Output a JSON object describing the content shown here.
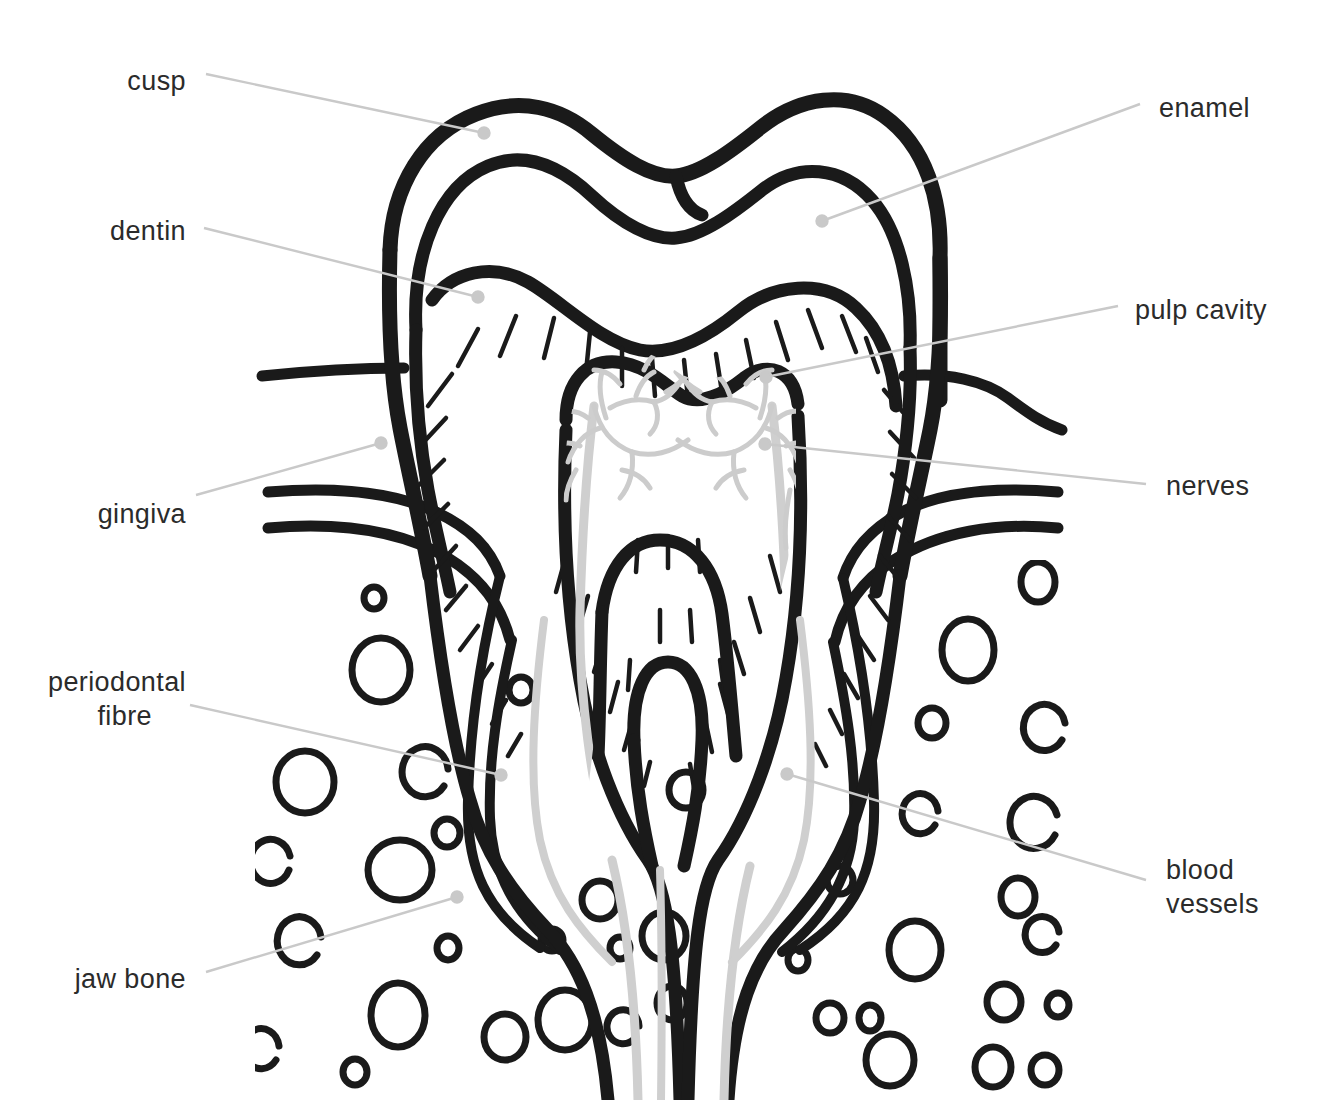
{
  "diagram": {
    "background_color": "#ffffff",
    "ink_color": "#1a1a1a",
    "leader_color": "#c9c9c9",
    "soft_tissue_color": "#d4d4d4",
    "label_color": "#2b2b2b"
  },
  "labels": {
    "left": [
      {
        "id": "cusp",
        "text": "cusp",
        "x": 186,
        "y": 90,
        "dot_x": 484,
        "dot_y": 133
      },
      {
        "id": "dentin",
        "text": "dentin",
        "x": 186,
        "y": 240,
        "dot_x": 478,
        "dot_y": 297
      },
      {
        "id": "gingiva",
        "text": "gingiva",
        "x": 186,
        "y": 523,
        "dot_x": 381,
        "dot_y": 443
      },
      {
        "id": "periodontal-fibre",
        "text": "periodontal",
        "text2": "fibre",
        "x": 186,
        "y": 691,
        "x2": 186,
        "y2": 725,
        "dot_x": 501,
        "dot_y": 775
      },
      {
        "id": "jaw-bone",
        "text": "jaw bone",
        "x": 186,
        "y": 988,
        "dot_x": 457,
        "dot_y": 897
      }
    ],
    "right": [
      {
        "id": "enamel",
        "text": "enamel",
        "x": 1159,
        "y": 117,
        "dot_x": 822,
        "dot_y": 221
      },
      {
        "id": "pulp-cavity",
        "text": "pulp cavity",
        "x": 1135,
        "y": 319,
        "dot_x": 766,
        "dot_y": 377
      },
      {
        "id": "nerves",
        "text": "nerves",
        "x": 1166,
        "y": 495,
        "dot_x": 765,
        "dot_y": 444
      },
      {
        "id": "blood-vessels",
        "text": "blood",
        "text2": "vessels",
        "x": 1166,
        "y": 879,
        "x2": 1166,
        "y2": 913,
        "dot_x": 787,
        "dot_y": 774
      }
    ]
  },
  "structures": [
    {
      "id": "enamel-layer",
      "label": "enamel"
    },
    {
      "id": "dentin-layer",
      "label": "dentin"
    },
    {
      "id": "pulp-cavity",
      "label": "pulp cavity"
    },
    {
      "id": "cusp",
      "label": "cusp"
    },
    {
      "id": "gingiva",
      "label": "gingiva"
    },
    {
      "id": "periodontal-fibre",
      "label": "periodontal fibre"
    },
    {
      "id": "jaw-bone",
      "label": "jaw bone"
    },
    {
      "id": "nerves",
      "label": "nerves"
    },
    {
      "id": "blood-vessels",
      "label": "blood vessels"
    }
  ]
}
